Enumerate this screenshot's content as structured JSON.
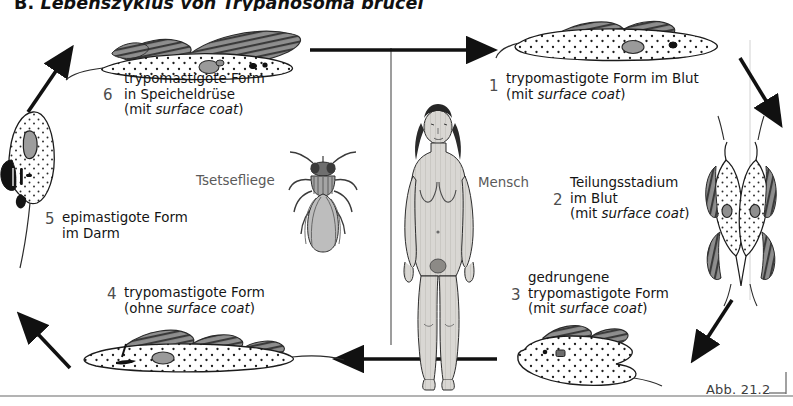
{
  "figure": {
    "title_prefix": "B. ",
    "title_main": "Lebenszyklus von ",
    "title_italic": "Trypanosoma brucei",
    "caption": "Abb. 21.2",
    "host_labels": {
      "vector": "Tsetsefliege",
      "host": "Mensch"
    },
    "stages": [
      {
        "number": "1",
        "line1": "trypomastigote Form im Blut",
        "line2_pre": "(mit ",
        "line2_italic": "surface coat",
        "line2_post": ")",
        "line3": ""
      },
      {
        "number": "2",
        "line1": "Teilungsstadium",
        "line0": "im Blut",
        "line2_pre": "(mit ",
        "line2_italic": "surface coat",
        "line2_post": ")"
      },
      {
        "number": "3",
        "line1": "gedrungene",
        "line0": "trypomastigote Form",
        "line2_pre": "(mit ",
        "line2_italic": "surface coat",
        "line2_post": ")"
      },
      {
        "number": "4",
        "line1": "trypomastigote Form",
        "line2_pre": "(ohne ",
        "line2_italic": "surface coat",
        "line2_post": ")"
      },
      {
        "number": "5",
        "line1": "epimastigote Form",
        "line0": "im Darm"
      },
      {
        "number": "6",
        "line1": "trypomastigote Form",
        "line0": "in Speicheldrüse",
        "line2_pre": "(mit ",
        "line2_italic": "surface coat",
        "line2_post": ")"
      }
    ],
    "colors": {
      "ink": "#141414",
      "number": "#4d4d4d",
      "muted": "#5a5a5a",
      "membrane": "#808080",
      "body_fill": "#ffffff",
      "organelle": "#9a9a9a",
      "human_fill": "#d8d6d2"
    }
  }
}
